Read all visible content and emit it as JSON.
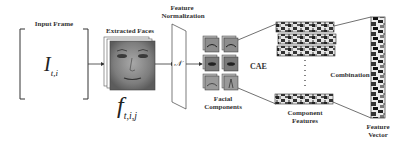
{
  "labels": {
    "input_frame": "Input Frame",
    "extracted_faces": "Extracted Faces",
    "feature_normalization_1": "Feature",
    "feature_normalization_2": "Normalization",
    "normalization_symbol": "𝒩",
    "cae": "CAE",
    "facial_components_1": "Facial",
    "facial_components_2": "Components",
    "component_features_1": "Component",
    "component_features_2": "Features",
    "combination": "Combination",
    "feature_vector_1": "Feature",
    "feature_vector_2": "Vector"
  },
  "math": {
    "input_symbol": "I",
    "input_subscript": "t,i",
    "face_symbol": "f",
    "face_subscript": "t,i,j"
  },
  "colors": {
    "line": "#333333",
    "face_gray": "#8a8a8a",
    "bar_dark": "#222222",
    "bar_mid": "#888888",
    "bar_light": "#e6e6e6"
  },
  "pipeline": [
    "Input Frame",
    "Extracted Faces",
    "Feature Normalization",
    "Facial Components",
    "CAE",
    "Component Features",
    "Combination",
    "Feature Vector"
  ]
}
